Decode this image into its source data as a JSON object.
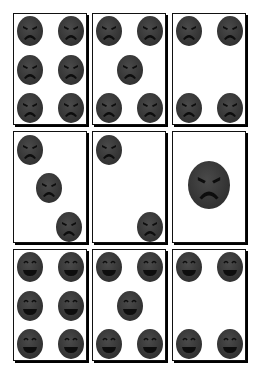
{
  "board": {
    "face_color": "#3a3a3a",
    "feature_color": "#0d0d0d",
    "cards": [
      {
        "id": 1,
        "row": 0,
        "col": 0,
        "mood": "angry",
        "count": 6,
        "x": 13,
        "y": 13,
        "pips": [
          [
            3,
            2,
            26,
            30
          ],
          [
            44,
            2,
            26,
            30
          ],
          [
            3,
            41,
            26,
            30
          ],
          [
            44,
            41,
            26,
            30
          ],
          [
            3,
            79,
            26,
            30
          ],
          [
            44,
            79,
            26,
            30
          ]
        ]
      },
      {
        "id": 2,
        "row": 0,
        "col": 1,
        "mood": "angry",
        "count": 5,
        "x": 92,
        "y": 13,
        "pips": [
          [
            3,
            2,
            26,
            30
          ],
          [
            44,
            2,
            26,
            30
          ],
          [
            24,
            41,
            26,
            30
          ],
          [
            3,
            79,
            26,
            30
          ],
          [
            44,
            79,
            26,
            30
          ]
        ]
      },
      {
        "id": 3,
        "row": 0,
        "col": 2,
        "mood": "angry",
        "count": 4,
        "x": 172,
        "y": 13,
        "pips": [
          [
            3,
            2,
            26,
            30
          ],
          [
            44,
            2,
            26,
            30
          ],
          [
            3,
            79,
            26,
            30
          ],
          [
            44,
            79,
            26,
            30
          ]
        ]
      },
      {
        "id": 4,
        "row": 1,
        "col": 0,
        "mood": "angry",
        "count": 3,
        "x": 13,
        "y": 131,
        "pips": [
          [
            3,
            3,
            26,
            30
          ],
          [
            22,
            41,
            26,
            30
          ],
          [
            42,
            80,
            26,
            30
          ]
        ]
      },
      {
        "id": 5,
        "row": 1,
        "col": 1,
        "mood": "angry",
        "count": 2,
        "x": 92,
        "y": 131,
        "pips": [
          [
            3,
            3,
            26,
            30
          ],
          [
            44,
            80,
            26,
            30
          ]
        ]
      },
      {
        "id": 6,
        "row": 1,
        "col": 2,
        "mood": "angry",
        "count": 1,
        "x": 172,
        "y": 131,
        "pips": [
          [
            15,
            29,
            42,
            48
          ]
        ]
      },
      {
        "id": 7,
        "row": 2,
        "col": 0,
        "mood": "happy",
        "count": 6,
        "x": 13,
        "y": 249,
        "pips": [
          [
            3,
            2,
            26,
            30
          ],
          [
            44,
            2,
            26,
            30
          ],
          [
            3,
            41,
            26,
            30
          ],
          [
            44,
            41,
            26,
            30
          ],
          [
            3,
            79,
            26,
            30
          ],
          [
            44,
            79,
            26,
            30
          ]
        ]
      },
      {
        "id": 8,
        "row": 2,
        "col": 1,
        "mood": "happy",
        "count": 5,
        "x": 92,
        "y": 249,
        "pips": [
          [
            3,
            2,
            26,
            30
          ],
          [
            44,
            2,
            26,
            30
          ],
          [
            24,
            41,
            26,
            30
          ],
          [
            3,
            79,
            26,
            30
          ],
          [
            44,
            79,
            26,
            30
          ]
        ]
      },
      {
        "id": 9,
        "row": 2,
        "col": 2,
        "mood": "happy",
        "count": 4,
        "x": 172,
        "y": 249,
        "pips": [
          [
            3,
            2,
            26,
            30
          ],
          [
            44,
            2,
            26,
            30
          ],
          [
            3,
            79,
            26,
            30
          ],
          [
            44,
            79,
            26,
            30
          ]
        ]
      }
    ]
  }
}
